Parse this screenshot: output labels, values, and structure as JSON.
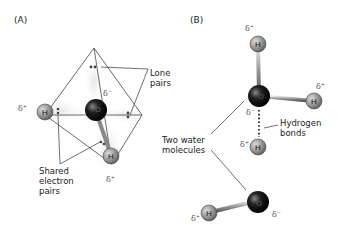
{
  "panels": {
    "a": {
      "label": "(A)",
      "labels": {
        "lone_pairs": "Lone\npairs",
        "shared_pairs": "Shared\nelectron\npairs"
      },
      "atoms": {
        "oxygen": "O",
        "h1": "H",
        "h2": "H"
      },
      "charges": {
        "o": "δ⁻",
        "h1": "δ⁺",
        "h2": "δ⁺"
      }
    },
    "b": {
      "label": "(B)",
      "labels": {
        "two_water": "Two water\nmolecules",
        "hbonds": "Hydrogen\nbonds"
      },
      "atoms": {
        "o_top": "O",
        "h_top": "H",
        "h_right": "H",
        "h_mid": "H",
        "o_bottom": "O",
        "h_left": "H"
      },
      "charges": {
        "h_top": "δ⁺",
        "h_right": "δ⁺",
        "o_top": "δ⁻",
        "h_mid": "δ⁺",
        "o_bottom": "δ⁻",
        "h_left": "δ⁺"
      }
    }
  }
}
